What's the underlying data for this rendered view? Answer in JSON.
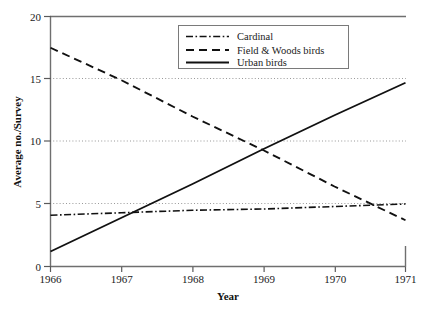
{
  "chart_data": {
    "type": "line",
    "title": "",
    "xlabel": "Year",
    "ylabel": "Average no./Survey",
    "xlim": [
      1966,
      1971
    ],
    "ylim": [
      0,
      20
    ],
    "xticks": [
      "1966",
      "1967",
      "1968",
      "1969",
      "1970",
      "1971"
    ],
    "yticks": [
      "0",
      "5",
      "10",
      "15",
      "20"
    ],
    "grid": "horizontal dotted gridlines at 5, 10, 15",
    "legend_position": "top-center",
    "x": [
      1966,
      1967,
      1968,
      1969,
      1970,
      1971
    ],
    "series": [
      {
        "name": "Cardinal",
        "style": "dash-dot",
        "values": [
          4.1,
          4.3,
          4.5,
          4.6,
          4.8,
          5.0
        ]
      },
      {
        "name": "Field & Woods birds",
        "style": "dashed",
        "values": [
          17.5,
          14.9,
          12.0,
          9.3,
          6.4,
          3.7
        ]
      },
      {
        "name": "Urban birds",
        "style": "solid",
        "values": [
          1.2,
          3.9,
          6.6,
          9.4,
          12.1,
          14.7
        ]
      }
    ],
    "annotations": [
      "Urban birds cross Cardinal between 1967 and 1968 near value 4.3",
      "Urban birds cross Field & Woods birds just after 1969 near value 9.4",
      "Field & Woods birds cross Cardinal near 1970.6 at value 4.9"
    ]
  },
  "axes": {
    "ylabel": "Average no./Survey",
    "xlabel": "Year",
    "yticks": [
      {
        "label": "20",
        "value": 20
      },
      {
        "label": "15",
        "value": 15
      },
      {
        "label": "10",
        "value": 10
      },
      {
        "label": "5",
        "value": 5
      },
      {
        "label": "0",
        "value": 0
      }
    ],
    "xticks": [
      {
        "label": "1966",
        "value": 1966
      },
      {
        "label": "1967",
        "value": 1967
      },
      {
        "label": "1968",
        "value": 1968
      },
      {
        "label": "1969",
        "value": 1969
      },
      {
        "label": "1970",
        "value": 1970
      },
      {
        "label": "1971",
        "value": 1971
      }
    ]
  },
  "legend": {
    "entries": [
      {
        "label": "Cardinal",
        "style": "dash-dot"
      },
      {
        "label": "Field & Woods birds",
        "style": "dashed"
      },
      {
        "label": "Urban birds",
        "style": "solid"
      }
    ]
  },
  "colors": {
    "ink": "#111111",
    "axis": "#6f6f6f",
    "grid": "#8d8d8d",
    "background": "#ffffff"
  }
}
